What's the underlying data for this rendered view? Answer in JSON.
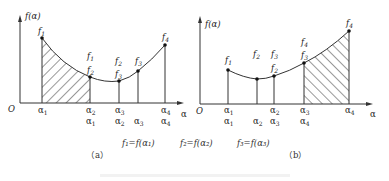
{
  "figure": {
    "panel_a": {
      "label": "（a）",
      "y_axis_label": "f(α)",
      "x_axis_label": "α",
      "origin_label": "O",
      "points": [
        {
          "name": "f1",
          "x": 42,
          "y": 38,
          "label": "f₁"
        },
        {
          "name": "f2",
          "x": 90,
          "y": 77,
          "label": "f₁ / f₂"
        },
        {
          "name": "f3",
          "x": 119,
          "y": 81,
          "label": "f₂ / f₃"
        },
        {
          "name": "f4a",
          "x": 138,
          "y": 71,
          "label": "f₃"
        },
        {
          "name": "f4",
          "x": 165,
          "y": 45,
          "label": "f₄"
        }
      ],
      "tick_row1": [
        "α₁",
        "α₂",
        "α₃",
        "α₄"
      ],
      "tick_row2": [
        "α₁",
        "α₂",
        "α₃",
        "α₄"
      ],
      "shaded_region": "α₁ to α₂"
    },
    "panel_b": {
      "label": "（b）",
      "y_axis_label": "f(α)",
      "x_axis_label": "α",
      "origin_label": "O",
      "points": [
        {
          "name": "f1",
          "x": 228,
          "y": 70,
          "label": "f₁"
        },
        {
          "name": "f2",
          "x": 257,
          "y": 79,
          "label": "f₂"
        },
        {
          "name": "f3",
          "x": 274,
          "y": 76,
          "label": "f₃ / f₂"
        },
        {
          "name": "f4a",
          "x": 304,
          "y": 63,
          "label": "f₄ / f₃"
        },
        {
          "name": "f4",
          "x": 349,
          "y": 31,
          "label": "f₄"
        }
      ],
      "tick_row1": [
        "α₁",
        "α₂",
        "α₃",
        "α₄"
      ],
      "tick_row2": [
        "α₁",
        "α₂",
        "α₃",
        "α₄"
      ],
      "shaded_region": "α₃ to α₄"
    },
    "formula": {
      "f1": "f₁=f(α₁)",
      "f2": "f₂=f(α₂)",
      "f3": "f₃=f(α₃)"
    }
  },
  "text": {
    "a_y": "f(α)",
    "b_y": "f(α)",
    "alpha": "α",
    "O": "O",
    "cap_a": "（a）",
    "cap_b": "（b）",
    "eq1": "f₁=f(α₁)",
    "eq2": "f₂=f(α₂)",
    "eq3": "f₃=f(α₃)"
  }
}
